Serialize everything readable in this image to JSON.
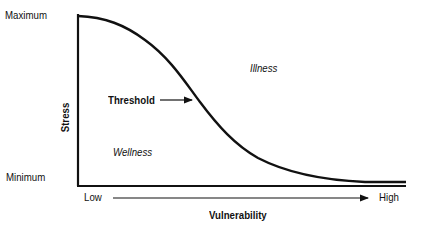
{
  "diagram": {
    "type": "stress-vulnerability-curve",
    "y_axis": {
      "label": "Stress",
      "top_label": "Maximum",
      "bottom_label": "Minimum"
    },
    "x_axis": {
      "label": "Vulnerability",
      "left_label": "Low",
      "right_label": "High"
    },
    "regions": {
      "above_curve": "Illness",
      "below_curve": "Wellness"
    },
    "annotation": {
      "label": "Threshold"
    },
    "colors": {
      "line": "#111111",
      "background": "#ffffff"
    }
  }
}
